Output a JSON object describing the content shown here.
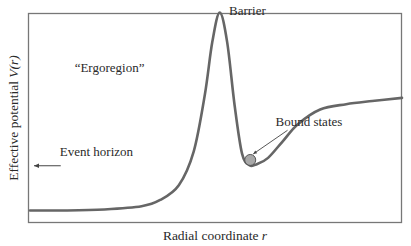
{
  "chart_data": {
    "type": "line",
    "title": "",
    "xlabel": "Radial coordinate",
    "xlabel_var": "r",
    "ylabel": "Effective potential",
    "ylabel_var": "V(r)",
    "grid": false,
    "x": [
      0.0,
      0.1,
      0.2,
      0.3,
      0.35,
      0.4,
      0.44,
      0.47,
      0.49,
      0.51,
      0.53,
      0.55,
      0.57,
      0.59,
      0.61,
      0.64,
      0.68,
      0.72,
      0.78,
      0.85,
      0.92,
      1.0
    ],
    "y": [
      0.05,
      0.05,
      0.055,
      0.07,
      0.1,
      0.17,
      0.33,
      0.6,
      0.85,
      0.99,
      0.85,
      0.55,
      0.32,
      0.265,
      0.27,
      0.3,
      0.38,
      0.46,
      0.53,
      0.555,
      0.57,
      0.585
    ],
    "xlim": [
      0,
      1
    ],
    "ylim": [
      0,
      1.05
    ],
    "annotations": [
      {
        "text": "Barrier",
        "x": 0.535,
        "y": 0.98
      },
      {
        "text": "“Ergoregion”",
        "x": 0.12,
        "y": 0.71
      },
      {
        "text": "Bound states",
        "x": 0.66,
        "y": 0.45,
        "arrow_to": {
          "x": 0.592,
          "y": 0.29
        }
      },
      {
        "text": "Event horizon",
        "x": 0.08,
        "y": 0.31,
        "arrow": "left"
      }
    ],
    "markers": [
      {
        "name": "bound-state-particle",
        "x": 0.592,
        "y": 0.29,
        "color": "#a8a8a8"
      }
    ],
    "colors": {
      "curve": "#666666",
      "frame": "#777777",
      "particle": "#a8a8a8"
    }
  }
}
